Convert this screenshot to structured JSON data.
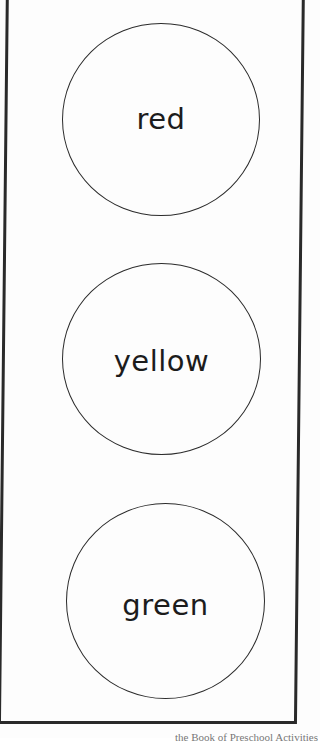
{
  "worksheet": {
    "circles": [
      {
        "label": "red"
      },
      {
        "label": "yellow"
      },
      {
        "label": "green"
      }
    ],
    "footer_text": "the Book of Preschool Activities"
  },
  "colors": {
    "background": "#fdfdfd",
    "line": "#2b2b2b",
    "text": "#1c1c1c"
  }
}
